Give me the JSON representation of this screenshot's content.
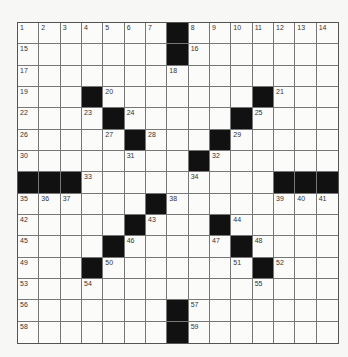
{
  "puzzle": {
    "size": 15,
    "black_cells": [
      [
        0,
        7
      ],
      [
        1,
        7
      ],
      [
        3,
        3
      ],
      [
        3,
        11
      ],
      [
        4,
        4
      ],
      [
        4,
        10
      ],
      [
        5,
        5
      ],
      [
        5,
        9
      ],
      [
        6,
        8
      ],
      [
        7,
        0
      ],
      [
        7,
        1
      ],
      [
        7,
        2
      ],
      [
        7,
        12
      ],
      [
        7,
        13
      ],
      [
        7,
        14
      ],
      [
        8,
        6
      ],
      [
        9,
        5
      ],
      [
        9,
        9
      ],
      [
        10,
        4
      ],
      [
        10,
        10
      ],
      [
        11,
        3
      ],
      [
        11,
        11
      ],
      [
        13,
        7
      ],
      [
        14,
        7
      ]
    ],
    "numbers": [
      {
        "r": 0,
        "c": 0,
        "n": "1"
      },
      {
        "r": 0,
        "c": 1,
        "n": "2"
      },
      {
        "r": 0,
        "c": 2,
        "n": "3"
      },
      {
        "r": 0,
        "c": 3,
        "n": "4"
      },
      {
        "r": 0,
        "c": 4,
        "n": "5"
      },
      {
        "r": 0,
        "c": 5,
        "n": "6"
      },
      {
        "r": 0,
        "c": 6,
        "n": "7"
      },
      {
        "r": 0,
        "c": 8,
        "n": "8"
      },
      {
        "r": 0,
        "c": 9,
        "n": "9"
      },
      {
        "r": 0,
        "c": 10,
        "n": "10"
      },
      {
        "r": 0,
        "c": 11,
        "n": "11"
      },
      {
        "r": 0,
        "c": 12,
        "n": "12"
      },
      {
        "r": 0,
        "c": 13,
        "n": "13"
      },
      {
        "r": 0,
        "c": 14,
        "n": "14"
      },
      {
        "r": 1,
        "c": 0,
        "n": "15"
      },
      {
        "r": 1,
        "c": 8,
        "n": "16"
      },
      {
        "r": 2,
        "c": 0,
        "n": "17"
      },
      {
        "r": 2,
        "c": 7,
        "n": "18"
      },
      {
        "r": 3,
        "c": 0,
        "n": "19"
      },
      {
        "r": 3,
        "c": 4,
        "n": "20"
      },
      {
        "r": 3,
        "c": 12,
        "n": "21"
      },
      {
        "r": 4,
        "c": 0,
        "n": "22"
      },
      {
        "r": 4,
        "c": 3,
        "n": "23"
      },
      {
        "r": 4,
        "c": 5,
        "n": "24"
      },
      {
        "r": 4,
        "c": 11,
        "n": "25"
      },
      {
        "r": 5,
        "c": 0,
        "n": "26"
      },
      {
        "r": 5,
        "c": 4,
        "n": "27"
      },
      {
        "r": 5,
        "c": 6,
        "n": "28"
      },
      {
        "r": 5,
        "c": 10,
        "n": "29"
      },
      {
        "r": 6,
        "c": 0,
        "n": "30"
      },
      {
        "r": 6,
        "c": 5,
        "n": "31"
      },
      {
        "r": 6,
        "c": 9,
        "n": "32"
      },
      {
        "r": 7,
        "c": 3,
        "n": "33"
      },
      {
        "r": 7,
        "c": 8,
        "n": "34"
      },
      {
        "r": 8,
        "c": 0,
        "n": "35"
      },
      {
        "r": 8,
        "c": 1,
        "n": "36"
      },
      {
        "r": 8,
        "c": 2,
        "n": "37"
      },
      {
        "r": 8,
        "c": 7,
        "n": "38"
      },
      {
        "r": 8,
        "c": 12,
        "n": "39"
      },
      {
        "r": 8,
        "c": 13,
        "n": "40"
      },
      {
        "r": 8,
        "c": 14,
        "n": "41"
      },
      {
        "r": 9,
        "c": 0,
        "n": "42"
      },
      {
        "r": 9,
        "c": 6,
        "n": "43"
      },
      {
        "r": 9,
        "c": 10,
        "n": "44"
      },
      {
        "r": 10,
        "c": 0,
        "n": "45"
      },
      {
        "r": 10,
        "c": 5,
        "n": "46"
      },
      {
        "r": 10,
        "c": 9,
        "n": "47"
      },
      {
        "r": 10,
        "c": 11,
        "n": "48"
      },
      {
        "r": 11,
        "c": 0,
        "n": "49"
      },
      {
        "r": 11,
        "c": 4,
        "n": "50"
      },
      {
        "r": 11,
        "c": 10,
        "n": "51"
      },
      {
        "r": 11,
        "c": 12,
        "n": "52"
      },
      {
        "r": 12,
        "c": 0,
        "n": "53"
      },
      {
        "r": 12,
        "c": 3,
        "n": "54"
      },
      {
        "r": 12,
        "c": 11,
        "n": "55"
      },
      {
        "r": 13,
        "c": 0,
        "n": "56"
      },
      {
        "r": 13,
        "c": 8,
        "n": "57"
      },
      {
        "r": 14,
        "c": 0,
        "n": "58"
      },
      {
        "r": 14,
        "c": 8,
        "n": "59"
      }
    ]
  }
}
